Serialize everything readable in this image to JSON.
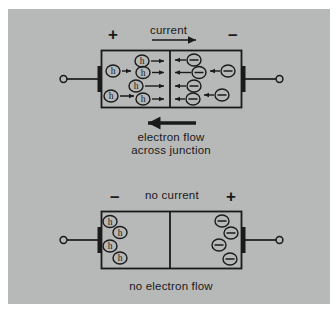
{
  "figure": {
    "background_color": "#b7b8b8",
    "page_color": "#ffffff",
    "ink_color": "#1a1a1a"
  },
  "diagrams": [
    {
      "id": "forward-bias",
      "polarity_left": "+",
      "polarity_right": "–",
      "top_label": "current",
      "top_arrow_direction": "right",
      "bottom_arrow_direction": "left",
      "caption_line1": "electron flow",
      "caption_line2": "across junction",
      "carriers_left": [
        {
          "symbol": "h",
          "arrow": "right"
        },
        {
          "symbol": "h",
          "arrow": "right"
        },
        {
          "symbol": "h",
          "arrow": "right"
        },
        {
          "symbol": "h",
          "arrow": "right"
        },
        {
          "symbol": "h",
          "arrow": "right"
        },
        {
          "symbol": "h",
          "arrow": "right"
        }
      ],
      "carriers_right": [
        {
          "symbol": "–",
          "arrow": "left"
        },
        {
          "symbol": "–",
          "arrow": "left"
        },
        {
          "symbol": "–",
          "arrow": "left"
        },
        {
          "symbol": "–",
          "arrow": "left"
        },
        {
          "symbol": "–",
          "arrow": "left"
        },
        {
          "symbol": "–",
          "arrow": "left"
        }
      ]
    },
    {
      "id": "reverse-bias",
      "polarity_left": "–",
      "polarity_right": "+",
      "top_label": "no current",
      "caption_line1": "no electron flow",
      "carriers_left": [
        {
          "symbol": "h"
        },
        {
          "symbol": "h"
        },
        {
          "symbol": "h"
        },
        {
          "symbol": "h"
        }
      ],
      "carriers_right": [
        {
          "symbol": "–"
        },
        {
          "symbol": "–"
        },
        {
          "symbol": "–"
        },
        {
          "symbol": "–"
        }
      ]
    }
  ],
  "legend": {
    "hole_symbol": "h",
    "electron_symbol": "–"
  }
}
